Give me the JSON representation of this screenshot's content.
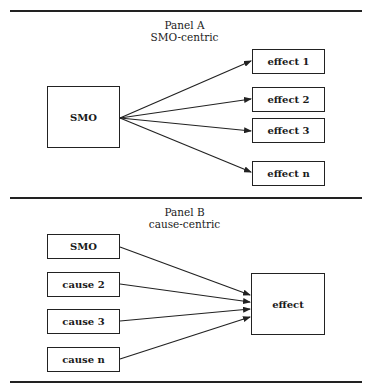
{
  "panel_a": {
    "title": "Panel A",
    "subtitle": "SMO-centric",
    "source": "SMO",
    "targets": [
      "effect 1",
      "effect 2",
      "effect 3",
      "effect n"
    ]
  },
  "panel_b": {
    "title": "Panel B",
    "subtitle": "cause-centric",
    "sources": [
      "SMO",
      "cause 2",
      "cause 3",
      "cause n"
    ],
    "target": "effect"
  },
  "colors": {
    "line": "#222222",
    "background": "#ffffff"
  }
}
